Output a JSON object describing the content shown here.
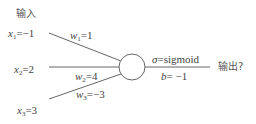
{
  "diagram": {
    "type": "perceptron",
    "input_header": "输入",
    "inputs": [
      {
        "var": "x",
        "sub": "1",
        "value": "=−1"
      },
      {
        "var": "x",
        "sub": "2",
        "value": "=2"
      },
      {
        "var": "x",
        "sub": "3",
        "value": "=3"
      }
    ],
    "weights": [
      {
        "var": "w",
        "sub": "1",
        "value": "=1"
      },
      {
        "var": "w",
        "sub": "2",
        "value": "=4"
      },
      {
        "var": "w",
        "sub": "3",
        "value": "=−3"
      }
    ],
    "activation": {
      "symbol": "σ",
      "value": "=sigmoid"
    },
    "bias": {
      "symbol": "b",
      "value": "= −1"
    },
    "output_label": "输出?",
    "colors": {
      "line": "#555555",
      "text": "#444444"
    }
  }
}
